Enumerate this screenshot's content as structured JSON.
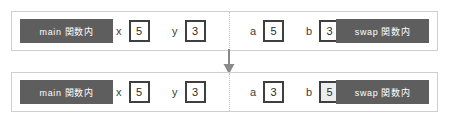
{
  "diagram": {
    "colors": {
      "chip_bg": "#5e5e5e",
      "chip_text": "#ffffff",
      "panel_border": "#cfcfcf",
      "box_border": "#3f3f3f",
      "box_highlight_bg": "#ededed",
      "divider": "#c8c8c8",
      "arrow": "#8a8a8a"
    },
    "arrow": {
      "icon": "arrow-down-icon",
      "direction": "down"
    },
    "rows": [
      {
        "id": "before",
        "left_scope_label": "main 関数内",
        "right_scope_label": "swap 関数内",
        "variables": [
          {
            "name": "x",
            "value": "5",
            "highlight": false
          },
          {
            "name": "y",
            "value": "3",
            "highlight": false
          },
          {
            "name": "a",
            "value": "5",
            "highlight": false
          },
          {
            "name": "b",
            "value": "3",
            "highlight": false
          }
        ]
      },
      {
        "id": "after",
        "left_scope_label": "main 関数内",
        "right_scope_label": "swap 関数内",
        "variables": [
          {
            "name": "x",
            "value": "5",
            "highlight": false
          },
          {
            "name": "y",
            "value": "3",
            "highlight": false
          },
          {
            "name": "a",
            "value": "3",
            "highlight": false
          },
          {
            "name": "b",
            "value": "5",
            "highlight": true
          }
        ]
      }
    ]
  }
}
